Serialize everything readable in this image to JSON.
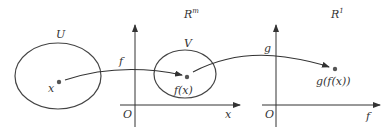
{
  "diagram": {
    "spaces": {
      "domain": {
        "set_label": "U",
        "point_label": "x"
      },
      "middle": {
        "space_label": "R",
        "space_sup": "m",
        "set_label": "V",
        "point_label": "f(x)",
        "x_axis_label": "x",
        "y_axis_label": "f",
        "origin_label": "O"
      },
      "codomain": {
        "space_label": "R",
        "space_sup": "1",
        "point_label": "g(f(x))",
        "x_axis_label": "f",
        "y_axis_label": "g",
        "origin_label": "O"
      }
    },
    "maps": [
      {
        "label": "f",
        "from": "x",
        "to": "f(x)"
      },
      {
        "label": "g",
        "from": "f(x)",
        "to": "g(f(x))"
      }
    ],
    "colors": {
      "stroke": "#333333",
      "point": "#555555"
    }
  }
}
